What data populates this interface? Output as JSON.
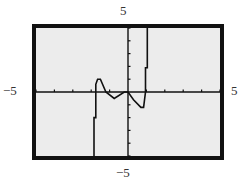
{
  "chart_data": {
    "type": "line",
    "title": "",
    "xlabel": "",
    "ylabel": "",
    "xlim": [
      -5,
      5
    ],
    "ylim": [
      -5,
      5
    ],
    "xscale": 1,
    "yscale": 1,
    "grid": false,
    "legend": null,
    "window_labels": {
      "xmin": "−5",
      "xmax": "5",
      "ymin": "−5",
      "ymax": "5"
    },
    "series": [
      {
        "name": "f(x)",
        "description": "Polynomial with a vertical asymptote-like steep rise near x=-2, local max near (-1.7, 1.0), local min near (-0.7, -0.5), crosses near origin, local min near (0.7, -1.2), steep rise after x=1",
        "points": [
          [
            -1.85,
            -5.0
          ],
          [
            -1.85,
            -2.0
          ],
          [
            -1.75,
            -2.0
          ],
          [
            -1.75,
            0.6
          ],
          [
            -1.65,
            1.0
          ],
          [
            -1.5,
            1.0
          ],
          [
            -1.2,
            0.0
          ],
          [
            -0.75,
            -0.5
          ],
          [
            -0.2,
            0.0
          ],
          [
            0.0,
            0.0
          ],
          [
            0.3,
            -0.6
          ],
          [
            0.7,
            -1.2
          ],
          [
            0.85,
            -1.2
          ],
          [
            0.95,
            0.0
          ],
          [
            0.95,
            1.9
          ],
          [
            1.05,
            1.9
          ],
          [
            1.05,
            5.0
          ]
        ]
      }
    ],
    "ticks": {
      "x": [
        -5,
        -4,
        -3,
        -2,
        -1,
        0,
        1,
        2,
        3,
        4,
        5
      ],
      "y": [
        -5,
        -4,
        -3,
        -2,
        -1,
        0,
        1,
        2,
        3,
        4,
        5
      ]
    }
  }
}
